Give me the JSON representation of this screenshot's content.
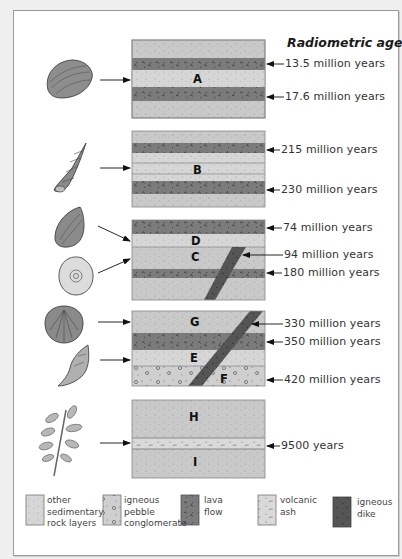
{
  "title": "Radiometric age",
  "colors": {
    "sedimentary": "#c9c9c9",
    "lava": "#7b7b7b",
    "dike": "#555555",
    "ash": "#dadada",
    "conglomerate": "#cfcfcf",
    "border": "#9a9a9a"
  },
  "blocks": [
    {
      "id": "A",
      "fossil": "clam",
      "labels": [
        "A"
      ],
      "ages": [
        "13.5 million years",
        "17.6 million years"
      ]
    },
    {
      "id": "B",
      "fossil": "high-spired-snail",
      "labels": [
        "B"
      ],
      "ages": [
        "215 million years",
        "230 million years"
      ]
    },
    {
      "id": "CD",
      "fossil": [
        "oyster",
        "ammonite"
      ],
      "labels": [
        "D",
        "C"
      ],
      "ages": [
        "74 million years",
        "94 million years",
        "180 million years"
      ]
    },
    {
      "id": "GEF",
      "fossil": [
        "scallop",
        "whelk"
      ],
      "labels": [
        "G",
        "E",
        "F"
      ],
      "ages": [
        "330 million years",
        "350 million years",
        "420 million years"
      ]
    },
    {
      "id": "HI",
      "fossil": "leaf",
      "labels": [
        "H",
        "I"
      ],
      "ages": [
        "9500 years"
      ]
    }
  ],
  "legend": [
    {
      "key": "sedimentary",
      "text": "other\nsedimentary\nrock layers"
    },
    {
      "key": "conglomerate",
      "text": "igneous\npebble\nconglomerate"
    },
    {
      "key": "lava",
      "text": "lava\nflow"
    },
    {
      "key": "ash",
      "text": "volcanic\nash"
    },
    {
      "key": "dike",
      "text": "igneous\ndike"
    }
  ]
}
